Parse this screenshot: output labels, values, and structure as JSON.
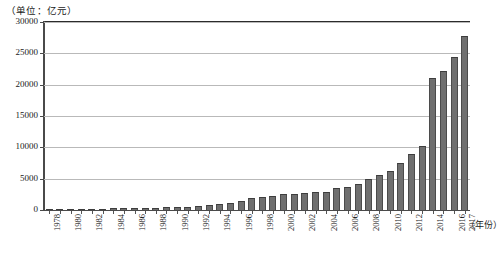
{
  "chart_data": {
    "type": "bar",
    "title": "",
    "unit_caption": "（单位：亿元）",
    "xlabel": "（年份）",
    "ylabel": "",
    "ylim": [
      0,
      30000
    ],
    "yticks": [
      0,
      5000,
      10000,
      15000,
      20000,
      25000,
      30000
    ],
    "ytick_labels": [
      "0",
      "5000",
      "10000",
      "15000",
      "20000",
      "25000",
      "30000"
    ],
    "grid": true,
    "legend": "none",
    "categories": [
      "1978",
      "1979",
      "1980",
      "1981",
      "1982",
      "1983",
      "1984",
      "1985",
      "1986",
      "1987",
      "1988",
      "1989",
      "1990",
      "1991",
      "1992",
      "1993",
      "1994",
      "1995",
      "1996",
      "1997",
      "1998",
      "1999",
      "2000",
      "2001",
      "2002",
      "2003",
      "2004",
      "2005",
      "2006",
      "2007",
      "2008",
      "2009",
      "2010",
      "2011",
      "2012",
      "2013",
      "2014",
      "2015",
      "2016",
      "2017"
    ],
    "tick_labels_shown": [
      "1978",
      "1980",
      "1982",
      "1984",
      "1986",
      "1988",
      "1990",
      "1992",
      "1994",
      "1996",
      "1998",
      "2000",
      "2002",
      "2004",
      "2006",
      "2008",
      "2010",
      "2012",
      "2014",
      "2016",
      "2017"
    ],
    "values": [
      110,
      130,
      150,
      170,
      190,
      210,
      250,
      280,
      300,
      330,
      400,
      430,
      520,
      560,
      620,
      760,
      900,
      1100,
      1500,
      1900,
      2100,
      2300,
      2500,
      2600,
      2700,
      2800,
      2950,
      3450,
      3600,
      4150,
      4900,
      5550,
      6200,
      7550,
      9000,
      10150,
      12600,
      15550,
      17400,
      19500
    ],
    "values_tail": {
      "2014": 21100,
      "2015": 22250,
      "2016": 24350,
      "2017": 27750
    },
    "bar_color": "#6f6f6f",
    "bar_edge_color": "#4b4b4b",
    "grid_color": "#b9b9b9",
    "axis_color": "#4a4a4a"
  }
}
